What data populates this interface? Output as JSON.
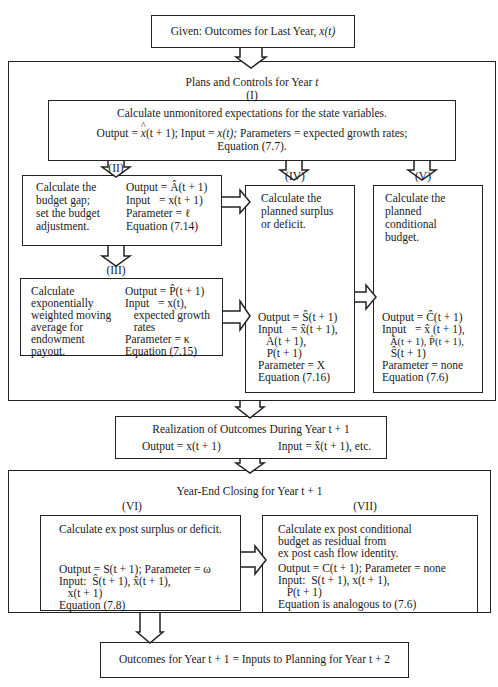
{
  "top": {
    "title": "Given: Outcomes for Last Year, ",
    "title_var": "x(t)"
  },
  "plans": {
    "title": "Plans and Controls for Year ",
    "title_var": "t",
    "box1": {
      "label": "(I)",
      "line1": "Calculate unmonitored expectations for the state variables.",
      "line2_a": "Output = ",
      "line2_hatvar": "x",
      "line2_b": "(t + 1); Input = ",
      "line2_c": "x(t);",
      "line2_d": " Parameters = expected growth rates;",
      "line3": "Equation (7.7)."
    },
    "box2": {
      "label": "(II)",
      "desc": [
        "Calculate the",
        "budget gap;",
        "set the budget",
        "adjustment."
      ],
      "params": [
        "Output = Â(t + 1)",
        "Input   = x(t + 1)",
        "Parameter = ℓ",
        "Equation (7.14)"
      ]
    },
    "box3": {
      "label": "(III)",
      "desc": [
        "Calculate",
        "exponentially",
        "weighted moving",
        "average for",
        "endowment",
        "payout."
      ],
      "params": [
        "Output = P̂(t + 1)",
        "Input   = x(t),",
        "   expected growth",
        "   rates",
        "Parameter = κ",
        "Equation (7.15)"
      ]
    },
    "box4": {
      "label": "(IV)",
      "desc": [
        "Calculate the",
        "planned surplus",
        "or deficit."
      ],
      "params": [
        "Output = Ŝ(t + 1)",
        "Input   = x̂(t + 1),",
        "   A(t + 1),",
        "   P(t + 1)",
        "Parameter = X",
        "Equation (7.16)"
      ]
    },
    "box5": {
      "label": "(V)",
      "desc": [
        "Calculate the",
        "planned",
        "conditional",
        "budget."
      ],
      "params": [
        "Output = Ĉ(t + 1)",
        "Input   = x̂ (t + 1),",
        "   Â(t + 1), P̂(t + 1),",
        "   Ŝ(t + 1)",
        "Parameter = none",
        "Equation (7.6)"
      ]
    }
  },
  "realization": {
    "title": "Realization of Outcomes During Year t + 1",
    "output": "Output = x(t + 1)",
    "input": "Input = x̂(t + 1), etc."
  },
  "closing": {
    "title": "Year-End Closing for Year t + 1",
    "box6": {
      "label": "(VI)",
      "desc": "Calculate ex post surplus or deficit.",
      "params": [
        "Output = S(t + 1); Parameter = ω",
        "Input:  Ŝ(t + 1), x̂(t + 1),",
        "   x(t + 1)",
        "Equation (7.8)"
      ]
    },
    "box7": {
      "label": "(VII)",
      "desc": [
        "Calculate ex post conditional",
        "budget as residual from",
        "ex post cash flow identity."
      ],
      "params": [
        "Output = C(t + 1); Parameter = none",
        "Input:  S(t + 1), x(t + 1),",
        "   P(t + 1)",
        "Equation is analogous to (7.6)"
      ]
    }
  },
  "final": {
    "title": "Outcomes for Year t + 1 = Inputs to Planning for Year t + 2"
  }
}
